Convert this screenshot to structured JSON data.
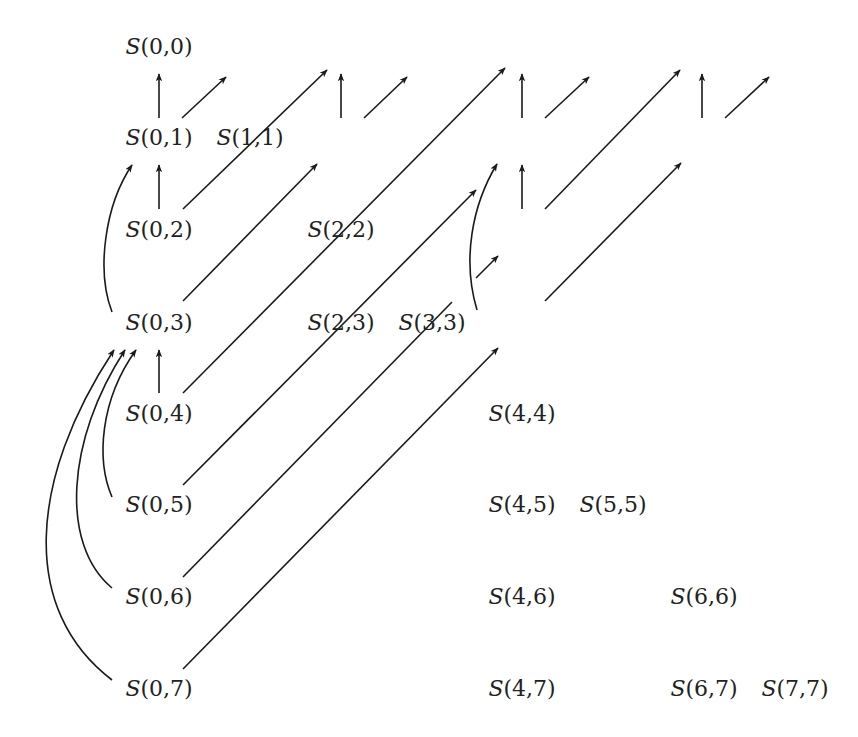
{
  "diagram": {
    "type": "dependency-graph",
    "stroke_color": "#1a1a1a",
    "text_color": "#222222",
    "background": "#ffffff",
    "columns_x": [
      159,
      250,
      341,
      432,
      522,
      613,
      704,
      795
    ],
    "rows_y": [
      46,
      137,
      229,
      322,
      413,
      504,
      596,
      688
    ],
    "nodes": [
      {
        "id": "0-0",
        "i": 0,
        "j": 0,
        "prefix": "S",
        "args": "(0,0)"
      },
      {
        "id": "1-1",
        "i": 1,
        "j": 1,
        "prefix": "S",
        "args": "(1,1)"
      },
      {
        "id": "2-2",
        "i": 2,
        "j": 2,
        "prefix": "S",
        "args": "(2,2)"
      },
      {
        "id": "3-3",
        "i": 3,
        "j": 3,
        "prefix": "S",
        "args": "(3,3)"
      },
      {
        "id": "4-4",
        "i": 4,
        "j": 4,
        "prefix": "S",
        "args": "(4,4)"
      },
      {
        "id": "5-5",
        "i": 5,
        "j": 5,
        "prefix": "S",
        "args": "(5,5)"
      },
      {
        "id": "6-6",
        "i": 6,
        "j": 6,
        "prefix": "S",
        "args": "(6,6)"
      },
      {
        "id": "7-7",
        "i": 7,
        "j": 7,
        "prefix": "S",
        "args": "(7,7)"
      },
      {
        "id": "0-1",
        "i": 0,
        "j": 1,
        "prefix": "S",
        "args": "(0,1)"
      },
      {
        "id": "2-3",
        "i": 2,
        "j": 3,
        "prefix": "S",
        "args": "(2,3)"
      },
      {
        "id": "4-5",
        "i": 4,
        "j": 5,
        "prefix": "S",
        "args": "(4,5)"
      },
      {
        "id": "6-7",
        "i": 6,
        "j": 7,
        "prefix": "S",
        "args": "(6,7)"
      },
      {
        "id": "0-2",
        "i": 0,
        "j": 2,
        "prefix": "S",
        "args": "(0,2)"
      },
      {
        "id": "4-6",
        "i": 4,
        "j": 6,
        "prefix": "S",
        "args": "(4,6)"
      },
      {
        "id": "0-3",
        "i": 0,
        "j": 3,
        "prefix": "S",
        "args": "(0,3)"
      },
      {
        "id": "4-7",
        "i": 4,
        "j": 7,
        "prefix": "S",
        "args": "(4,7)"
      },
      {
        "id": "0-4",
        "i": 0,
        "j": 4,
        "prefix": "S",
        "args": "(0,4)"
      },
      {
        "id": "0-5",
        "i": 0,
        "j": 5,
        "prefix": "S",
        "args": "(0,5)"
      },
      {
        "id": "0-6",
        "i": 0,
        "j": 6,
        "prefix": "S",
        "args": "(0,6)"
      },
      {
        "id": "0-7",
        "i": 0,
        "j": 7,
        "prefix": "S",
        "args": "(0,7)"
      }
    ],
    "edges": [
      {
        "from": "0-1",
        "to": "0-0",
        "kind": "straight",
        "d": "M159 118 L159 74"
      },
      {
        "from": "0-1",
        "to": "1-1",
        "kind": "straight",
        "d": "M182 118 L226 77"
      },
      {
        "from": "2-3",
        "to": "2-2",
        "kind": "straight",
        "d": "M341 118 L341 74"
      },
      {
        "from": "2-3",
        "to": "3-3",
        "kind": "straight",
        "d": "M364 118 L407 77"
      },
      {
        "from": "4-5",
        "to": "4-4",
        "kind": "straight",
        "d": "M522 118 L522 74"
      },
      {
        "from": "4-5",
        "to": "5-5",
        "kind": "straight",
        "d": "M545 118 L589 77"
      },
      {
        "from": "6-7",
        "to": "6-6",
        "kind": "straight",
        "d": "M702 118 L702 74"
      },
      {
        "from": "6-7",
        "to": "7-7",
        "kind": "straight",
        "d": "M725 118 L769 77"
      },
      {
        "from": "0-2",
        "to": "0-1",
        "kind": "straight",
        "d": "M159 209 L159 165"
      },
      {
        "from": "0-2",
        "to": "2-2",
        "kind": "straight",
        "d": "M183 209 L327 70"
      },
      {
        "from": "0-3",
        "to": "0-1",
        "kind": "curve",
        "d": "M112 312 C 96 270, 105 205, 132 165"
      },
      {
        "from": "0-3",
        "to": "2-3",
        "kind": "straight",
        "d": "M183 301 L317 164"
      },
      {
        "from": "4-6",
        "to": "4-5",
        "kind": "straight",
        "d": "M522 209 L522 165"
      },
      {
        "from": "4-6",
        "to": "6-6",
        "kind": "straight",
        "d": "M545 209 L680 70"
      },
      {
        "from": "4-7",
        "to": "4-5",
        "kind": "curve",
        "d": "M477 310 C 462 260, 472 205, 497 164"
      },
      {
        "from": "4-7",
        "to": "6-7",
        "kind": "straight",
        "d": "M545 301 L681 163"
      },
      {
        "from": "0-4",
        "to": "0-3",
        "kind": "straight",
        "d": "M159 393 L159 350"
      },
      {
        "from": "0-4",
        "to": "4-4",
        "kind": "straight",
        "d": "M183 393 L505 68"
      },
      {
        "from": "0-5",
        "to": "0-3",
        "kind": "curve",
        "d": "M112 497 C 96 460, 100 400, 136 350"
      },
      {
        "from": "0-5",
        "to": "4-5",
        "kind": "straight",
        "d": "M183 485 L476 190"
      },
      {
        "from": "0-6",
        "to": "0-3",
        "kind": "curve",
        "d": "M112 588 C 60 545, 66 440, 125 350"
      },
      {
        "from": "0-6",
        "to": "4-6",
        "kind": "broken",
        "d": "M183 577 L452 302",
        "d2": "M476 278 L498 256"
      },
      {
        "from": "0-7",
        "to": "0-3",
        "kind": "curve",
        "d": "M112 680 C 20 610, 28 480, 114 350"
      },
      {
        "from": "0-7",
        "to": "4-7",
        "kind": "straight",
        "d": "M183 669 L498 348"
      }
    ]
  }
}
